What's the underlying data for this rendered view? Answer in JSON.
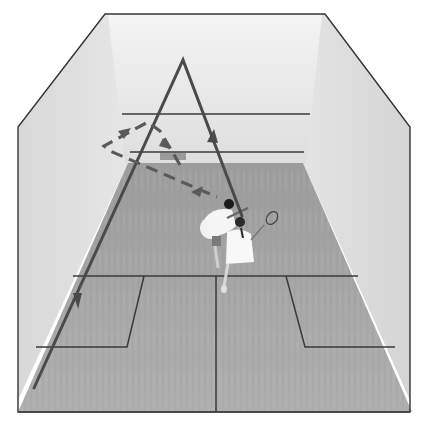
{
  "image": {
    "description": "Overhead photo of a squash court with two players, overlaid with shot-path diagrams",
    "alt": "Squash court with boast and drive shot paths"
  },
  "colors": {
    "background": "#ffffff",
    "front_wall": "#e8e8e8",
    "side_wall": "#dcdcdc",
    "floor": "#a9a9a9",
    "court_lines": "#3a3a3a",
    "path_solid": "#4a4a4a",
    "path_dashed": "#5a5a5a",
    "outline": "#333333"
  },
  "overlays": {
    "solid_path": {
      "label": "straight drive path (A shape)",
      "style": "solid",
      "arrows": 2
    },
    "dashed_path": {
      "label": "boast path via side wall",
      "style": "dashed",
      "arrows": 3
    }
  },
  "players": [
    {
      "label": "player in white shirt, dark shorts"
    },
    {
      "label": "player in white dress with racket"
    }
  ]
}
